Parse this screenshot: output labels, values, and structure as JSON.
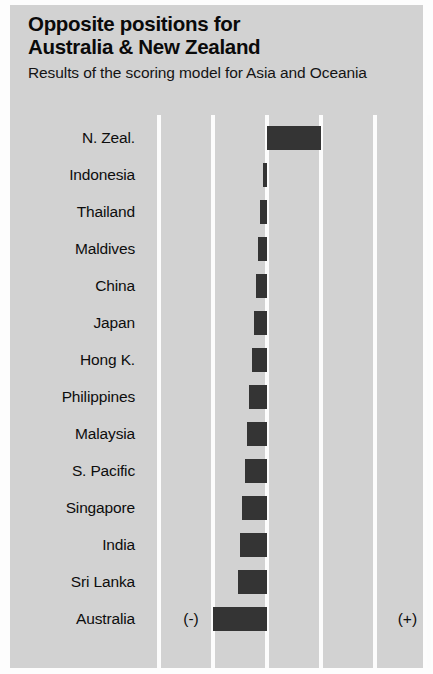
{
  "header": {
    "title_line1": "Opposite positions for",
    "title_line2": "Australia & New Zealand",
    "subtitle": "Results of the scoring model for Asia and Oceania"
  },
  "axis": {
    "negative_label": "(-)",
    "positive_label": "(+)"
  },
  "colors": {
    "panel_background": "#d2d2d2",
    "bar": "#343434",
    "gridline": "#fcfcfc",
    "text": "#0d0d0d"
  },
  "chart_data": {
    "type": "bar",
    "orientation": "horizontal",
    "title": "Opposite positions for Australia & New Zealand",
    "subtitle": "Results of the scoring model for Asia and Oceania",
    "xlabel": "",
    "ylabel": "",
    "xlim": [
      -2,
      3
    ],
    "grid": true,
    "gridlines_x": [
      -2,
      -1,
      0,
      1,
      2,
      3
    ],
    "zero_axis": 0,
    "legend": "none",
    "annotations": [
      "(-)",
      "(+)"
    ],
    "categories": [
      "N. Zeal.",
      "Indonesia",
      "Thailand",
      "Maldives",
      "China",
      "Japan",
      "Hong K.",
      "Philippines",
      "Malaysia",
      "S. Pacific",
      "Singapore",
      "India",
      "Sri Lanka",
      "Australia"
    ],
    "values": [
      1.0,
      -0.07,
      -0.13,
      -0.17,
      -0.2,
      -0.24,
      -0.28,
      -0.33,
      -0.37,
      -0.41,
      -0.46,
      -0.5,
      -0.54,
      -1.0
    ]
  }
}
